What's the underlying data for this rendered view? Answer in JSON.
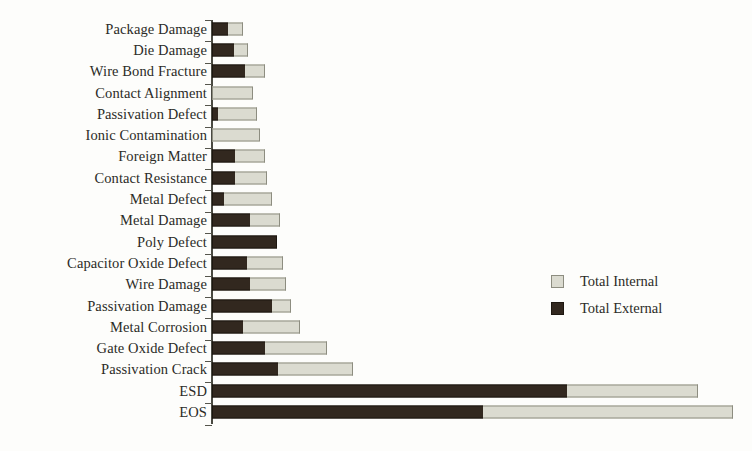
{
  "chart_data": {
    "type": "bar",
    "orientation": "horizontal",
    "stacked": true,
    "title": "",
    "subtitle": "",
    "xlabel": "",
    "ylabel": "",
    "grid": false,
    "axis_tick_labels": [],
    "xlim": [
      0,
      530
    ],
    "legend_position": "center-right",
    "categories": [
      "Package Damage",
      "Die Damage",
      "Wire Bond Fracture",
      "Contact Alignment",
      "Passivation Defect",
      "Ionic Contamination",
      "Foreign Matter",
      "Contact Resistance",
      "Metal Defect",
      "Metal Damage",
      "Poly Defect",
      "Capacitor Oxide Defect",
      "Wire Damage",
      "Passivation Damage",
      "Metal Corrosion",
      "Gate Oxide Defect",
      "Passivation Crack",
      "ESD",
      "EOS"
    ],
    "series": [
      {
        "name": "Total External",
        "color": "#32281f",
        "values": [
          16,
          22,
          33,
          0,
          6,
          0,
          23,
          23,
          12,
          38,
          65,
          35,
          38,
          60,
          31,
          53,
          66,
          355,
          271
        ]
      },
      {
        "name": "Total Internal",
        "color": "#dbdbd0",
        "values": [
          15,
          14,
          20,
          41,
          39,
          48,
          30,
          32,
          48,
          30,
          0,
          36,
          36,
          19,
          57,
          62,
          75,
          131,
          250
        ]
      }
    ],
    "totals": [
      31,
      36,
      53,
      41,
      45,
      48,
      53,
      55,
      60,
      68,
      65,
      71,
      74,
      79,
      88,
      115,
      141,
      486,
      521
    ]
  },
  "legend": {
    "entries": [
      {
        "label": "Total Internal",
        "swatch": "internal"
      },
      {
        "label": "Total External",
        "swatch": "external"
      }
    ]
  },
  "colors": {
    "background": "#fdfdfb",
    "external": "#32281f",
    "internal": "#dbdbd0",
    "axis": "#4a4a42",
    "text": "#2b2b27"
  }
}
